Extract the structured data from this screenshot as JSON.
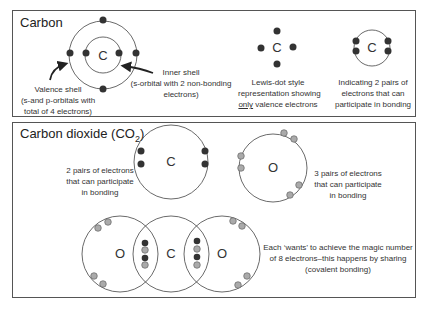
{
  "panels": {
    "carbon": {
      "title": "Carbon",
      "atom_symbol": "C",
      "valence_label": [
        "Valence shell",
        "(s-and p-orbitals with",
        "total of 4 electrons)"
      ],
      "inner_label": [
        "Inner shell",
        "(s-orbital with 2 non-bonding",
        "electrons)"
      ],
      "lewis_symbol": "C",
      "lewis_caption": [
        "Lewis-dot style",
        "representation showing"
      ],
      "lewis_caption_underlined": "only",
      "lewis_caption_rest": " valence electrons",
      "pairs_symbol": "C",
      "pairs_caption": [
        "Indicating 2 pairs of",
        "electrons that can",
        "participate in bonding"
      ]
    },
    "co2": {
      "title": "Carbon dioxide (CO",
      "title_subscript": "2",
      "title_close": ")",
      "carbon_symbol": "C",
      "carbon_caption": [
        "2 pairs of electrons",
        "that can participate",
        "in bonding"
      ],
      "oxygen_symbol": "O",
      "oxygen_caption": [
        "3 pairs of electrons",
        "that can participate",
        "in bonding"
      ],
      "molecule_symbols": [
        "O",
        "C",
        "O"
      ],
      "molecule_caption": [
        "Each ‘wants’ to achieve the magic number",
        "of 8 electrons–this happens by sharing",
        "(covalent bonding)"
      ]
    }
  },
  "colors": {
    "carbon_electron": "#333333",
    "oxygen_electron": "#aaaaaa",
    "line": "#444444",
    "border": "#555555"
  }
}
